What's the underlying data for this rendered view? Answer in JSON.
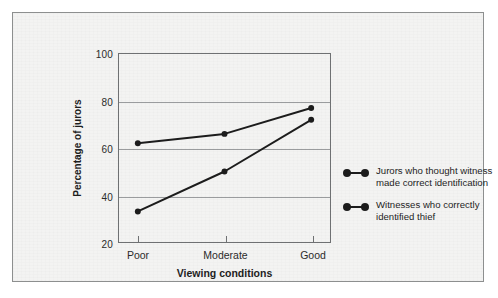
{
  "chart_data": {
    "type": "line",
    "title": "",
    "xlabel": "Viewing conditions",
    "ylabel": "Percentage of jurors",
    "categories": [
      "Poor",
      "Moderate",
      "Good"
    ],
    "ylim": [
      20,
      100
    ],
    "yticks": [
      20,
      40,
      60,
      80,
      100
    ],
    "ytick_labels": [
      "20",
      "40",
      "60",
      "80",
      "100"
    ],
    "grid": "horizontal",
    "legend_position": "right",
    "series": [
      {
        "name": "Jurors who thought witness made correct identification",
        "values": [
          62,
          66,
          77
        ],
        "color": "#1c1c1c",
        "marker": "circle"
      },
      {
        "name": "Witnesses who correctly identified thief",
        "values": [
          33,
          50,
          72
        ],
        "color": "#1c1c1c",
        "marker": "circle"
      }
    ]
  },
  "legend": {
    "entries": [
      {
        "label": "Jurors who thought witness made correct identification"
      },
      {
        "label": "Witnesses who correctly identified thief"
      }
    ]
  },
  "colors": {
    "panel_background": "#f3f3f2",
    "panel_border": "#8d8f8f",
    "axis": "#6f7173",
    "gridline": "#9a9c9e",
    "series": "#1c1c1c",
    "text": "#1e1e1e"
  }
}
